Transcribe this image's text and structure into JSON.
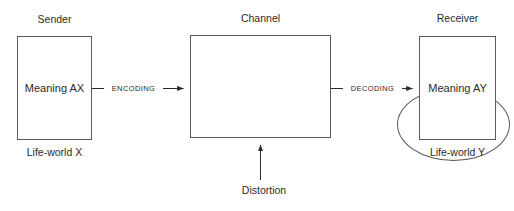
{
  "diagram": {
    "background_color": "#ffffff",
    "stroke_color": "#5a5a5a",
    "text_color": "#2b2b2b"
  },
  "sender": {
    "caption": "Sender",
    "box_text": "Meaning AX",
    "footer": "Life-world X"
  },
  "channel": {
    "caption": "Channel",
    "message_line1": "Ambiguous",
    "message_line2": "message"
  },
  "receiver": {
    "caption": "Receiver",
    "box_text": "Meaning AY",
    "footer": "Life-world Y"
  },
  "arrows": {
    "encoding_label": "ENCODING",
    "decoding_label": "DECODING",
    "distortion_label": "Distortion"
  }
}
